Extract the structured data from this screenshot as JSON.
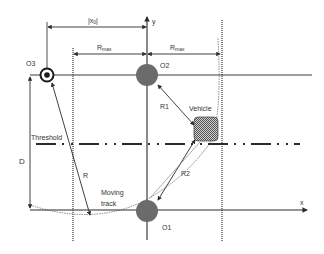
{
  "diagram": {
    "labels": {
      "x0": "|x",
      "x0_sub": "0",
      "x0_end": "|",
      "rmax": "R",
      "rmax_sub": "max",
      "y_axis": "y",
      "x_axis": "x",
      "o1": "O1",
      "o2": "O2",
      "o3": "O3",
      "r1": "R1",
      "r2": "R2",
      "r": "R",
      "vehicle": "Vehicle",
      "threshold": "Threshold",
      "d": "D",
      "moving": "Moving",
      "track": "track"
    },
    "colors": {
      "line": "#3a3a3a",
      "circle_fill": "#6b6b6b",
      "vehicle_fill": "#9a9a9a",
      "threshold": "#2b2b2b"
    }
  }
}
